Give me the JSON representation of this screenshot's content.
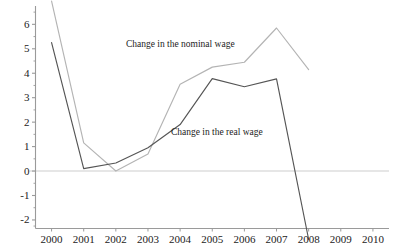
{
  "chart_data": {
    "type": "line",
    "title": "",
    "xlabel": "",
    "ylabel": "",
    "x": [
      2000,
      2001,
      2002,
      2003,
      2004,
      2005,
      2006,
      2007,
      2008
    ],
    "xlim": [
      1999.5,
      2010.5
    ],
    "ylim": [
      -2.35,
      6.75
    ],
    "grid": false,
    "zero_line": true,
    "legend_position": "inline-annotations",
    "x_tick_labels": [
      "2000",
      "2001",
      "2002",
      "2003",
      "2004",
      "2005",
      "2006",
      "2007",
      "2008",
      "2009",
      "2010"
    ],
    "y_tick_labels": [
      "6",
      "5",
      "4",
      "3",
      "2",
      "1",
      "0",
      "-1",
      "-2"
    ],
    "y_tick_values": [
      6,
      5,
      4,
      3,
      2,
      1,
      0,
      -1,
      -2
    ],
    "y_minor_tick_step": 0.5,
    "series": [
      {
        "name": "Change in the nominal wage",
        "color": "#b4b4b4",
        "clipped_at_top": true,
        "clipped_at_bottom": false,
        "values": [
          6.95,
          1.15,
          0.0,
          0.7,
          3.55,
          4.25,
          4.45,
          5.85,
          4.15
        ]
      },
      {
        "name": "Change in the real wage",
        "color": "#555555",
        "clipped_at_top": false,
        "clipped_at_bottom": true,
        "values": [
          5.25,
          0.1,
          0.33,
          0.95,
          1.9,
          3.78,
          3.45,
          3.77,
          -2.8
        ]
      }
    ],
    "annotations": [
      {
        "text": "Change in the nominal wage",
        "x": 2004.15,
        "y": 5.15
      },
      {
        "text": "Change in the real wage",
        "x": 2005.3,
        "y": 1.55
      }
    ],
    "axis_color": "#9a9a9a",
    "zero_line_color": "#e6e6e6",
    "background": "#ffffff"
  }
}
